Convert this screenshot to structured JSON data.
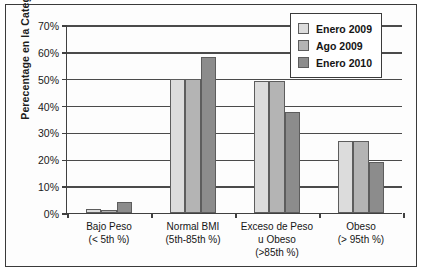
{
  "chart_data": {
    "type": "bar",
    "title": "",
    "xlabel": "",
    "ylabel": "Perecentage en la Categoría",
    "ylim": [
      0,
      70
    ],
    "ytick_labels": [
      "0%",
      "10%",
      "20%",
      "30%",
      "40%",
      "50%",
      "60%",
      "70%"
    ],
    "ytick_values": [
      0,
      10,
      20,
      30,
      40,
      50,
      60,
      70
    ],
    "grid": true,
    "legend_position": "top-right",
    "categories": [
      "Bajo Peso\n(< 5th %)",
      "Normal BMI\n(5th-85th %)",
      "Exceso de Peso\nu Obeso\n(>85th %)",
      "Obeso\n(> 95th %)"
    ],
    "category_lines": [
      [
        "Bajo Peso",
        "(< 5th %)"
      ],
      [
        "Normal BMI",
        "(5th-85th %)"
      ],
      [
        "Exceso de Peso",
        "u Obeso",
        "(>85th %)"
      ],
      [
        "Obeso",
        "(> 95th %)"
      ]
    ],
    "series": [
      {
        "name": "Enero 2009",
        "color": "#dcdcdc",
        "values": [
          1.5,
          50,
          49,
          27
        ]
      },
      {
        "name": "Ago 2009",
        "color": "#b4b4b4",
        "values": [
          1,
          50,
          49,
          26.8
        ]
      },
      {
        "name": "Enero 2010",
        "color": "#8c8c8c",
        "values": [
          4,
          58,
          37.5,
          19
        ]
      }
    ]
  },
  "legend": {
    "items": [
      {
        "label": "Enero 2009"
      },
      {
        "label": "Ago 2009"
      },
      {
        "label": "Enero 2010"
      }
    ]
  }
}
